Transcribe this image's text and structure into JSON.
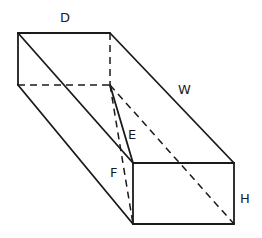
{
  "diagram": {
    "title": "",
    "labels": {
      "depth": "D",
      "width": "W",
      "height": "H",
      "face_diagonal": "E",
      "space_diagonal": "F"
    },
    "vertices": {
      "A": [
        18,
        33
      ],
      "B": [
        110,
        33
      ],
      "C": [
        18,
        85
      ],
      "G": [
        110,
        85
      ],
      "P": [
        133,
        163
      ],
      "Q": [
        234,
        163
      ],
      "R": [
        234,
        224
      ],
      "S": [
        133,
        224
      ]
    },
    "edges_solid": [
      [
        "A",
        "B"
      ],
      [
        "A",
        "C"
      ],
      [
        "A",
        "P"
      ],
      [
        "C",
        "S"
      ],
      [
        "B",
        "Q"
      ],
      [
        "P",
        "Q"
      ],
      [
        "Q",
        "R"
      ],
      [
        "R",
        "S"
      ],
      [
        "S",
        "P"
      ],
      [
        "G",
        "P"
      ]
    ],
    "edges_dashed": [
      [
        "B",
        "G"
      ],
      [
        "C",
        "G"
      ],
      [
        "G",
        "R"
      ],
      [
        "G",
        "S"
      ]
    ],
    "line_color": "#1a1a1a",
    "background": "#ffffff"
  }
}
